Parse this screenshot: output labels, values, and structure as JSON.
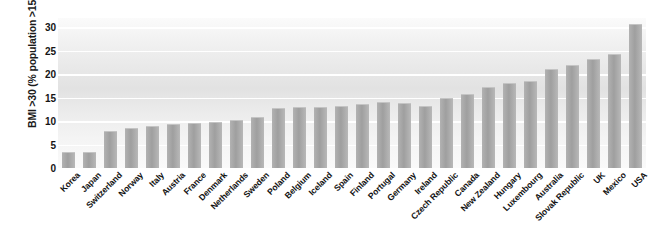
{
  "chart_data": {
    "type": "bar",
    "title": "",
    "xlabel": "",
    "ylabel": "BMI >30 (% population >15 years)",
    "ylim": [
      0,
      32
    ],
    "yticks": [
      0,
      5,
      10,
      15,
      20,
      25,
      30
    ],
    "grid": "horizontal",
    "legend": "none",
    "bar_color": "#a9a9a9",
    "plot_background": "#ededed",
    "gridline_color": "#ffffff",
    "categories": [
      "Korea",
      "Japan",
      "Switzerland",
      "Norway",
      "Italy",
      "Austria",
      "France",
      "Denmark",
      "Netherlands",
      "Sweden",
      "Poland",
      "Belgium",
      "Iceland",
      "Spain",
      "Finland",
      "Portugal",
      "Germany",
      "Ireland",
      "Czech Republic",
      "Canada",
      "New Zealand",
      "Hungary",
      "Luxembourg",
      "Australia",
      "Slovak Republic",
      "UK",
      "Mexico",
      "USA"
    ],
    "values": [
      3.2,
      3.2,
      7.7,
      8.3,
      8.8,
      9.1,
      9.4,
      9.5,
      10.0,
      10.7,
      12.5,
      12.7,
      12.8,
      13.1,
      13.5,
      13.8,
      13.6,
      13.0,
      14.8,
      15.5,
      17.0,
      18.0,
      18.4,
      21.0,
      21.8,
      23.0,
      24.2,
      30.6
    ]
  }
}
